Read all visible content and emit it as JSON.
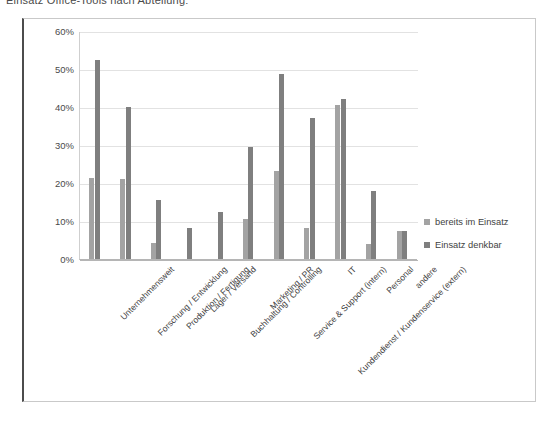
{
  "caption": {
    "text": "Einsatz Office-Tools nach Abteilung:"
  },
  "legend": {
    "items": [
      {
        "label": "bereits im Einsatz",
        "color": "#a3a3a3"
      },
      {
        "label": "Einsatz denkbar",
        "color": "#7f7f7f"
      }
    ]
  },
  "chart_data": {
    "type": "bar",
    "title": "Einsatz Office-Tools nach Abteilung:",
    "xlabel": "",
    "ylabel": "",
    "ylim": [
      0,
      60
    ],
    "yticks": [
      "0%",
      "10%",
      "20%",
      "30%",
      "40%",
      "50%",
      "60%"
    ],
    "ytick_values": [
      0,
      10,
      20,
      30,
      40,
      50,
      60
    ],
    "grid": true,
    "legend_position": "right",
    "categories": [
      "Unternehmensweit",
      "Forschung / Entwicklung",
      "Produktion / Fertigung",
      "Lager / Versand",
      "Buchhaltung / Controlling",
      "Marketing / PR",
      "Service & Support (intern)",
      "Kundendienst / Kundenservice (extern)",
      "IT",
      "Personal",
      "andere"
    ],
    "series": [
      {
        "name": "bereits im Einsatz",
        "color": "#a3a3a3",
        "values": [
          21.2,
          21.0,
          4.2,
          0,
          0,
          10.4,
          23.2,
          8.2,
          40.5,
          4.0,
          7.3
        ]
      },
      {
        "name": "Einsatz denkbar",
        "color": "#7f7f7f",
        "values": [
          52.5,
          40.1,
          15.6,
          8.2,
          12.5,
          29.4,
          48.6,
          37.0,
          42.0,
          18.0,
          7.3
        ]
      }
    ]
  }
}
